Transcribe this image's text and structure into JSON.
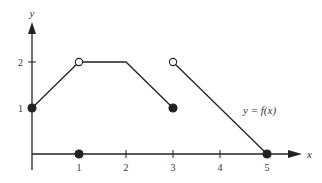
{
  "chart_data": {
    "type": "line",
    "title": "",
    "xlabel": "x",
    "ylabel": "y",
    "function_label": "y = f(x)",
    "xlim": [
      0,
      5.5
    ],
    "ylim": [
      0,
      2.5
    ],
    "x_ticks": [
      1,
      2,
      3,
      4,
      5
    ],
    "x_tick_labels": [
      "1",
      "2",
      "3",
      "4",
      "5"
    ],
    "y_ticks": [
      1,
      2
    ],
    "y_tick_labels": [
      "1",
      "2"
    ],
    "grid": false,
    "segments": [
      {
        "points": [
          [
            0,
            1
          ],
          [
            1,
            2
          ]
        ]
      },
      {
        "points": [
          [
            1,
            2
          ],
          [
            2,
            2
          ],
          [
            3,
            1
          ]
        ]
      },
      {
        "points": [
          [
            3,
            2
          ],
          [
            5,
            0
          ]
        ]
      }
    ],
    "points": [
      {
        "x": 0,
        "y": 1,
        "filled": true
      },
      {
        "x": 1,
        "y": 2,
        "filled": false
      },
      {
        "x": 1,
        "y": 0,
        "filled": true
      },
      {
        "x": 3,
        "y": 1,
        "filled": true
      },
      {
        "x": 3,
        "y": 2,
        "filled": false
      },
      {
        "x": 5,
        "y": 0,
        "filled": true
      }
    ],
    "colors": {
      "line": "#222222",
      "open_fill": "#ffffff"
    }
  }
}
